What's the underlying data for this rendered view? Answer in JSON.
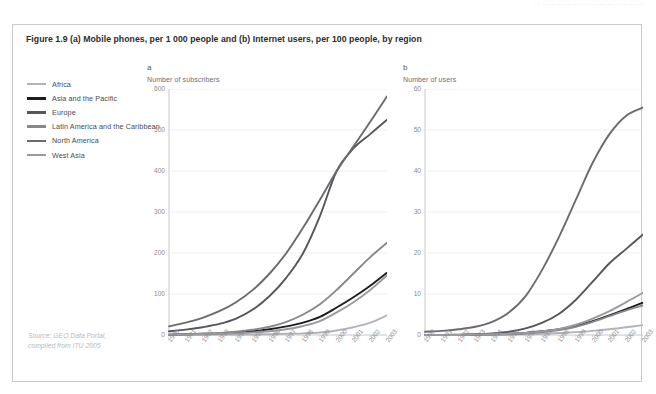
{
  "page": {
    "topstrip_text": "·  ·   ···  ·· ··· ·· ·  ·· ·· ·· ···  ··· ·  ··  ··· ···"
  },
  "figure": {
    "caption": "Figure 1.9 (a) Mobile phones, per 1 000 people and (b) Internet users, per 100 people, by region",
    "source_line1": "Source: GEO Data Portal,",
    "source_line2": "compiled from ITU 2005"
  },
  "legend": {
    "items": [
      {
        "label": "Africa",
        "color": "#b4b4b8"
      },
      {
        "label": "Asia and the Pacific",
        "color": "#1d1d1f"
      },
      {
        "label": "Europe",
        "color": "#56565b"
      },
      {
        "label": "Latin America and the Caribbean",
        "color": "#87878c"
      },
      {
        "label": "North America",
        "color": "#6a6a6f"
      },
      {
        "label": "West Asia",
        "color": "#9a9a9f"
      }
    ]
  },
  "chart_data": [
    {
      "type": "line",
      "panel": "a",
      "title": "a",
      "ylabel": "Number of subscribers",
      "xlabel": "",
      "ylim": [
        0,
        600
      ],
      "yticks": [
        0,
        100,
        200,
        300,
        400,
        500,
        600
      ],
      "grid": true,
      "legend_position": "outside-left",
      "x": [
        "1990",
        "1991",
        "1992",
        "1993",
        "1994",
        "1995",
        "1996",
        "1997",
        "1998",
        "1999",
        "2000",
        "2001",
        "2002",
        "2003"
      ],
      "series": [
        {
          "name": "Africa",
          "color": "#b4b4b8",
          "values": [
            0,
            0,
            0,
            1,
            1,
            1,
            2,
            3,
            4,
            6,
            11,
            19,
            30,
            48
          ]
        },
        {
          "name": "Asia and the Pacific",
          "color": "#1d1d1f",
          "values": [
            1,
            2,
            3,
            4,
            6,
            9,
            14,
            21,
            30,
            44,
            67,
            92,
            120,
            152
          ]
        },
        {
          "name": "Europe",
          "color": "#56565b",
          "values": [
            9,
            13,
            19,
            27,
            40,
            62,
            95,
            140,
            200,
            290,
            400,
            455,
            490,
            525
          ]
        },
        {
          "name": "Latin America and the Caribbean",
          "color": "#87878c",
          "values": [
            1,
            2,
            3,
            5,
            8,
            13,
            20,
            32,
            50,
            75,
            110,
            150,
            190,
            225
          ]
        },
        {
          "name": "North America",
          "color": "#6a6a6f",
          "values": [
            21,
            30,
            42,
            58,
            80,
            110,
            150,
            200,
            262,
            330,
            400,
            460,
            520,
            582
          ]
        },
        {
          "name": "West Asia",
          "color": "#9a9a9f",
          "values": [
            1,
            1,
            2,
            3,
            4,
            6,
            9,
            14,
            22,
            34,
            55,
            80,
            110,
            145
          ]
        }
      ]
    },
    {
      "type": "line",
      "panel": "b",
      "title": "b",
      "ylabel": "Number of users",
      "xlabel": "",
      "ylim": [
        0,
        60
      ],
      "yticks": [
        0,
        10,
        20,
        30,
        40,
        50,
        60
      ],
      "grid": true,
      "legend_position": "outside-left",
      "x": [
        "1990",
        "1991",
        "1992",
        "1993",
        "1994",
        "1995",
        "1996",
        "1997",
        "1998",
        "1999",
        "2000",
        "2001",
        "2002",
        "2003"
      ],
      "series": [
        {
          "name": "Africa",
          "color": "#b4b4b8",
          "values": [
            0,
            0,
            0,
            0,
            0.1,
            0.1,
            0.2,
            0.3,
            0.5,
            0.7,
            1.0,
            1.4,
            1.9,
            2.4
          ]
        },
        {
          "name": "Asia and the Pacific",
          "color": "#1d1d1f",
          "values": [
            0,
            0,
            0,
            0.1,
            0.2,
            0.3,
            0.5,
            0.9,
            1.4,
            2.2,
            3.4,
            4.8,
            6.3,
            7.9
          ]
        },
        {
          "name": "Europe",
          "color": "#56565b",
          "values": [
            0,
            0,
            0.1,
            0.2,
            0.4,
            0.8,
            1.6,
            3.0,
            5.2,
            8.6,
            13.0,
            17.5,
            21.0,
            24.5
          ]
        },
        {
          "name": "Latin America and the Caribbean",
          "color": "#87878c",
          "values": [
            0,
            0,
            0,
            0.1,
            0.1,
            0.2,
            0.4,
            0.7,
            1.2,
            2.0,
            3.2,
            4.6,
            6.0,
            7.2
          ]
        },
        {
          "name": "North America",
          "color": "#6a6a6f",
          "values": [
            0.8,
            1.0,
            1.4,
            2.0,
            3.2,
            5.5,
            9.5,
            16.0,
            24.0,
            33.0,
            42.0,
            49.0,
            53.5,
            55.5
          ]
        },
        {
          "name": "West Asia",
          "color": "#9a9a9f",
          "values": [
            0,
            0,
            0,
            0.1,
            0.2,
            0.3,
            0.5,
            0.9,
            1.5,
            2.5,
            4.0,
            5.8,
            8.0,
            10.3
          ]
        }
      ]
    }
  ]
}
